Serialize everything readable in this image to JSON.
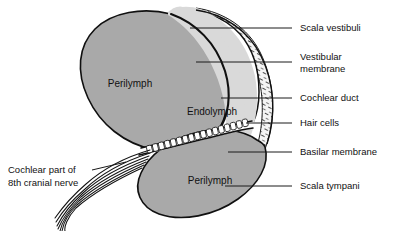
{
  "figure": {
    "width": 402,
    "height": 231,
    "background": "#ffffff"
  },
  "colors": {
    "perilymph_fill": "#a9a9a9",
    "endolymph_fill": "#d9d9d9",
    "scala_vestibuli_fill": "#ffffff",
    "bone_fill": "#f2f2f2",
    "outline": "#101010",
    "leader_line": "#1a1a1a",
    "text": "#111111"
  },
  "interior_labels": [
    {
      "id": "perilymph-upper",
      "text": "Perilymph",
      "x": 130,
      "y": 84
    },
    {
      "id": "endolymph",
      "text": "Endolymph",
      "x": 212,
      "y": 112
    },
    {
      "id": "perilymph-lower",
      "text": "Perilymph",
      "x": 210,
      "y": 181
    }
  ],
  "callouts_right": [
    {
      "id": "scala-vestibuli",
      "text": "Scala vestibuli",
      "text_x": 300,
      "text_y": 28,
      "leader": {
        "x1": 190,
        "y1": 28,
        "x2": 292,
        "y2": 28
      }
    },
    {
      "id": "vestibular-membrane",
      "text_line1": "Vestibular",
      "text_line2": "membrane",
      "text_x": 300,
      "text_y": 62,
      "leader": {
        "x1": 196,
        "y1": 62,
        "x2": 292,
        "y2": 62
      }
    },
    {
      "id": "cochlear-duct",
      "text": "Cochlear duct",
      "text_x": 300,
      "text_y": 98,
      "leader": {
        "x1": 221,
        "y1": 98,
        "x2": 292,
        "y2": 98
      }
    },
    {
      "id": "hair-cells",
      "text": "Hair cells",
      "text_x": 300,
      "text_y": 123,
      "leader": {
        "x1": 246,
        "y1": 123,
        "x2": 292,
        "y2": 123
      }
    },
    {
      "id": "basilar-membrane",
      "text": "Basilar membrane",
      "text_x": 300,
      "text_y": 152,
      "leader": {
        "x1": 228,
        "y1": 152,
        "x2": 292,
        "y2": 152
      }
    },
    {
      "id": "scala-tympani",
      "text": "Scala tympani",
      "text_x": 300,
      "text_y": 186,
      "leader": {
        "x1": 225,
        "y1": 186,
        "x2": 292,
        "y2": 186
      }
    }
  ],
  "callout_left": {
    "id": "cochlear-nerve",
    "text_line1": "Cochlear part of",
    "text_line2": "8th cranial nerve",
    "text_x": 8,
    "text_y": 175,
    "leader": {
      "x1": 92,
      "y1": 170,
      "x2": 123,
      "y2": 163
    }
  },
  "structures": [
    {
      "id": "scala-vestibuli-chamber",
      "name": "Scala vestibuli"
    },
    {
      "id": "vestibular-membrane-line",
      "name": "Vestibular membrane"
    },
    {
      "id": "cochlear-duct-chamber",
      "name": "Cochlear duct"
    },
    {
      "id": "hair-cell-row",
      "name": "Hair cells",
      "count": 17
    },
    {
      "id": "basilar-membrane-band",
      "name": "Basilar membrane"
    },
    {
      "id": "scala-tympani-chamber",
      "name": "Scala tympani"
    },
    {
      "id": "nerve-fiber-bundle",
      "name": "Cochlear nerve fibers",
      "count": 7
    },
    {
      "id": "bone-hatching",
      "name": "Bone (stippled)"
    }
  ]
}
